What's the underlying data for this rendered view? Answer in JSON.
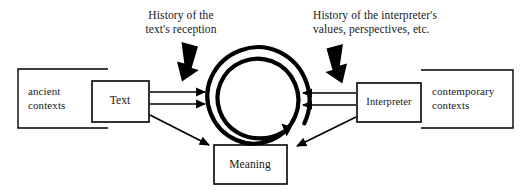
{
  "diagram": {
    "type": "concept-diagram",
    "canvas": {
      "width": 527,
      "height": 193,
      "background": "#ffffff"
    },
    "stroke_color": "#000000",
    "annotations": [
      {
        "id": "text-reception",
        "text": "History of the\ntext's reception",
        "align": "center",
        "points_to": "spiral"
      },
      {
        "id": "interpreter-values",
        "text": "History of the interpreter's\nvalues, perspectives, etc.",
        "align": "left",
        "points_to": "spiral"
      }
    ],
    "contexts": [
      {
        "id": "ancient-contexts",
        "text": "ancient\ncontexts",
        "side": "left",
        "open_side": "right"
      },
      {
        "id": "contemporary-contexts",
        "text": "contemporary\ncontexts",
        "side": "right",
        "open_side": "left"
      }
    ],
    "boxes": [
      {
        "id": "text",
        "label": "Text"
      },
      {
        "id": "interpreter",
        "label": "Interpreter"
      },
      {
        "id": "meaning",
        "label": "Meaning"
      }
    ],
    "center": {
      "id": "spiral",
      "shape": "inward-clockwise-spiral",
      "turns": 2.6
    },
    "arrows": [
      {
        "from": "text",
        "to": "spiral",
        "style": "thin",
        "kind": "horizontal-upper"
      },
      {
        "from": "text",
        "to": "spiral",
        "style": "thin",
        "kind": "horizontal-lower"
      },
      {
        "from": "text",
        "to": "meaning",
        "style": "thin",
        "kind": "diagonal"
      },
      {
        "from": "interpreter",
        "to": "spiral",
        "style": "thin",
        "kind": "horizontal-upper"
      },
      {
        "from": "interpreter",
        "to": "spiral",
        "style": "thin",
        "kind": "horizontal-lower"
      },
      {
        "from": "interpreter",
        "to": "meaning",
        "style": "thin",
        "kind": "diagonal"
      },
      {
        "from": "text-reception",
        "to": "spiral",
        "style": "thick-block",
        "kind": "down-right"
      },
      {
        "from": "interpreter-values",
        "to": "spiral",
        "style": "thick-block",
        "kind": "down-left"
      }
    ]
  }
}
